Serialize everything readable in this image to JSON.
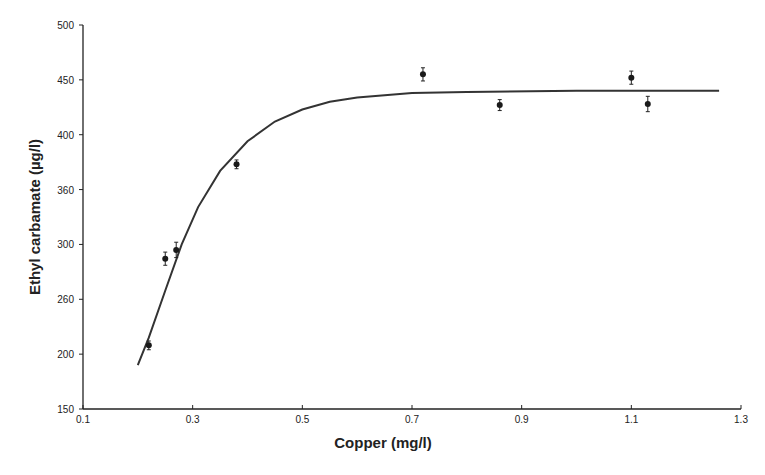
{
  "chart_data": {
    "type": "scatter",
    "title": "",
    "xlabel": "Copper (mg/l)",
    "ylabel": "Ethyl carbamate (µg/l)",
    "xlim": [
      0.1,
      1.3
    ],
    "ylim": [
      150,
      500
    ],
    "x_ticks": [
      0.1,
      0.3,
      0.5,
      0.7,
      0.9,
      1.1,
      1.3
    ],
    "x_tick_labels": [
      "0.1",
      "0.3",
      "0.5",
      "0.7",
      "0.9",
      "1.1",
      "1.3"
    ],
    "y_ticks": [
      150,
      200,
      250,
      300,
      350,
      400,
      450,
      500
    ],
    "y_tick_labels": [
      "150",
      "200",
      "260",
      "300",
      "360",
      "400",
      "450",
      "500"
    ],
    "grid": false,
    "legend": null,
    "series": [
      {
        "name": "measured",
        "type": "scatter",
        "marker": "filled-circle",
        "error_bars": true,
        "points": [
          {
            "x": 0.22,
            "y": 208,
            "err": 4
          },
          {
            "x": 0.25,
            "y": 287,
            "err": 6
          },
          {
            "x": 0.27,
            "y": 295,
            "err": 7
          },
          {
            "x": 0.38,
            "y": 373,
            "err": 4
          },
          {
            "x": 0.72,
            "y": 455,
            "err": 6
          },
          {
            "x": 0.86,
            "y": 427,
            "err": 5
          },
          {
            "x": 1.1,
            "y": 452,
            "err": 6
          },
          {
            "x": 1.13,
            "y": 428,
            "err": 7
          }
        ]
      },
      {
        "name": "fitted curve",
        "type": "line",
        "description": "saturating exponential fit, plateau ~440",
        "points": [
          {
            "x": 0.2,
            "y": 190
          },
          {
            "x": 0.22,
            "y": 215
          },
          {
            "x": 0.25,
            "y": 258
          },
          {
            "x": 0.28,
            "y": 300
          },
          {
            "x": 0.31,
            "y": 334
          },
          {
            "x": 0.35,
            "y": 367
          },
          {
            "x": 0.4,
            "y": 394
          },
          {
            "x": 0.45,
            "y": 412
          },
          {
            "x": 0.5,
            "y": 423
          },
          {
            "x": 0.55,
            "y": 430
          },
          {
            "x": 0.6,
            "y": 434
          },
          {
            "x": 0.7,
            "y": 438
          },
          {
            "x": 0.8,
            "y": 439
          },
          {
            "x": 1.0,
            "y": 440
          },
          {
            "x": 1.26,
            "y": 440
          }
        ]
      }
    ],
    "colors": {
      "axis": "#222222",
      "data": "#1a1a1a",
      "curve": "#333333"
    }
  }
}
